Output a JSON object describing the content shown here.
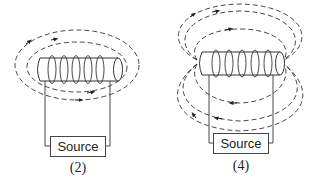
{
  "figures": [
    {
      "id": "2",
      "caption": "(2)",
      "source_label": "Source",
      "description": "Solenoid with closed field loops encircling the coil (toroidal-like field lines around coil)"
    },
    {
      "id": "4",
      "caption": "(4)",
      "source_label": "Source",
      "description": "Solenoid with dipole field lines looping from end to end above and below the coil"
    }
  ],
  "colors": {
    "line": "#333333",
    "background": "#ffffff"
  }
}
